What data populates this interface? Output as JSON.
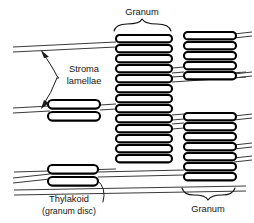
{
  "diagram": {
    "background_color": "#ffffff",
    "stroke_color": "#000000",
    "lamella_color": "#3a3a3a",
    "width": 254,
    "height": 223
  },
  "labels": {
    "granum_top": "Granum",
    "granum_bottom": "Granum",
    "stroma_line1": "Stroma",
    "stroma_line2": "lamellae",
    "thylakoid_line1": "Thylakoid",
    "thylakoid_line2": "(granum disc)"
  },
  "grana": [
    {
      "name": "central-granum",
      "label": "Granum",
      "disc_count": 13,
      "x": 114,
      "width": 60,
      "y_top": 35,
      "disc_pitch": 9.7,
      "disc_height": 7.2
    },
    {
      "name": "top-right-granum",
      "disc_count": 5,
      "x": 180,
      "width": 56,
      "y_top": 32,
      "disc_pitch": 9.7,
      "disc_height": 7.2
    },
    {
      "name": "bottom-right-granum",
      "label": "Granum",
      "disc_count": 7,
      "x": 180,
      "width": 56,
      "y_top": 113,
      "disc_pitch": 9.7,
      "disc_height": 7.2
    },
    {
      "name": "middle-left-granum",
      "disc_count": 2,
      "x": 48,
      "width": 52,
      "y_top": 103,
      "disc_pitch": 11.5,
      "disc_height": 8.5
    },
    {
      "name": "bottom-left-granum",
      "label": "Thylakoid (granum disc)",
      "disc_count": 2,
      "x": 48,
      "width": 50,
      "y_top": 167,
      "disc_pitch": 11.5,
      "disc_height": 8.5
    }
  ],
  "stroma_lamellae": [
    {
      "name": "lamella-upper-left",
      "x1": 14,
      "y1": 50,
      "x2": 115,
      "y2": 44
    },
    {
      "name": "lamella-middle-left",
      "x1": 14,
      "y1": 110,
      "x2": 50,
      "y2": 108
    },
    {
      "name": "lamella-bottom-left",
      "x1": 14,
      "y1": 180,
      "x2": 50,
      "y2": 176
    },
    {
      "name": "lamella-center-to-right-upper",
      "x1": 174,
      "y1": 72,
      "x2": 246,
      "y2": 70
    },
    {
      "name": "lamella-center-to-right-mid",
      "x1": 174,
      "y1": 112,
      "x2": 246,
      "y2": 110
    },
    {
      "name": "lamella-bottom-span",
      "x1": 14,
      "y1": 192,
      "x2": 246,
      "y2": 188
    }
  ],
  "annotations": {
    "stroma_pointer_name": "stroma-lamellae-pointer",
    "thylakoid_pointer_name": "thylakoid-pointer",
    "top_brace_name": "granum-top-brace",
    "bottom_brace_name": "granum-bottom-brace"
  }
}
